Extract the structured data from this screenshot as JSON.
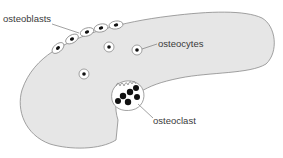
{
  "diagram": {
    "colors": {
      "bone_fill": "#e6e6e6",
      "outline": "#8a8a8a",
      "nucleus": "#111111",
      "cell_fill": "#ffffff",
      "label": "#3a3a3a",
      "leader": "#7a7a7a"
    },
    "labels": {
      "osteoblasts": "osteoblasts",
      "osteocytes": "osteocytes",
      "osteoclast": "osteoclast"
    },
    "cells": {
      "osteoblasts": [
        {
          "cx": 58,
          "cy": 48,
          "rot": -40
        },
        {
          "cx": 72,
          "cy": 39,
          "rot": -30
        },
        {
          "cx": 87,
          "cy": 32,
          "rot": -20
        },
        {
          "cx": 101,
          "cy": 28,
          "rot": -12
        },
        {
          "cx": 116,
          "cy": 25,
          "rot": -8
        }
      ],
      "osteocytes": [
        {
          "cx": 109,
          "cy": 47
        },
        {
          "cx": 137,
          "cy": 50
        },
        {
          "cx": 84,
          "cy": 74
        }
      ],
      "osteoclast_nuclei": [
        {
          "cx": 123,
          "cy": 96
        },
        {
          "cx": 130,
          "cy": 93
        },
        {
          "cx": 135,
          "cy": 89
        },
        {
          "cx": 136,
          "cy": 97
        },
        {
          "cx": 127,
          "cy": 102
        },
        {
          "cx": 117,
          "cy": 101
        }
      ]
    }
  }
}
